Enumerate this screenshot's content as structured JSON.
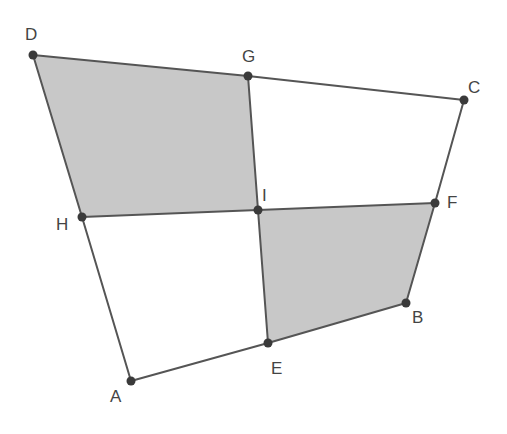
{
  "diagram": {
    "type": "geometry",
    "colors": {
      "fill": "#c8c8c8",
      "stroke": "#555555",
      "point": "#3a3a3a",
      "label": "#444444",
      "background": "#ffffff"
    },
    "points": [
      {
        "name": "A",
        "x": 131,
        "y": 381,
        "label": "A",
        "lx": 110,
        "ly": 402
      },
      {
        "name": "B",
        "x": 406,
        "y": 303,
        "label": "B",
        "lx": 412,
        "ly": 323
      },
      {
        "name": "C",
        "x": 464,
        "y": 100,
        "label": "C",
        "lx": 468,
        "ly": 93
      },
      {
        "name": "D",
        "x": 33,
        "y": 55,
        "label": "D",
        "lx": 25,
        "ly": 40
      },
      {
        "name": "E",
        "x": 268,
        "y": 343,
        "label": "E",
        "lx": 271,
        "ly": 374
      },
      {
        "name": "F",
        "x": 435,
        "y": 203,
        "label": "F",
        "lx": 447,
        "ly": 208
      },
      {
        "name": "G",
        "x": 248,
        "y": 76,
        "label": "G",
        "lx": 242,
        "ly": 62
      },
      {
        "name": "H",
        "x": 82,
        "y": 217,
        "label": "H",
        "lx": 56,
        "ly": 230
      },
      {
        "name": "I",
        "x": 258,
        "y": 210,
        "label": "I",
        "lx": 262,
        "ly": 201
      }
    ],
    "shaded_regions": [
      {
        "name": "DGIH",
        "vertices": [
          "D",
          "G",
          "I",
          "H"
        ]
      },
      {
        "name": "IEBF",
        "vertices": [
          "I",
          "E",
          "B",
          "F"
        ]
      }
    ],
    "segments": [
      [
        "A",
        "E"
      ],
      [
        "E",
        "B"
      ],
      [
        "B",
        "F"
      ],
      [
        "F",
        "C"
      ],
      [
        "C",
        "G"
      ],
      [
        "G",
        "D"
      ],
      [
        "D",
        "H"
      ],
      [
        "H",
        "A"
      ],
      [
        "G",
        "I"
      ],
      [
        "I",
        "E"
      ],
      [
        "H",
        "I"
      ],
      [
        "I",
        "F"
      ]
    ]
  }
}
